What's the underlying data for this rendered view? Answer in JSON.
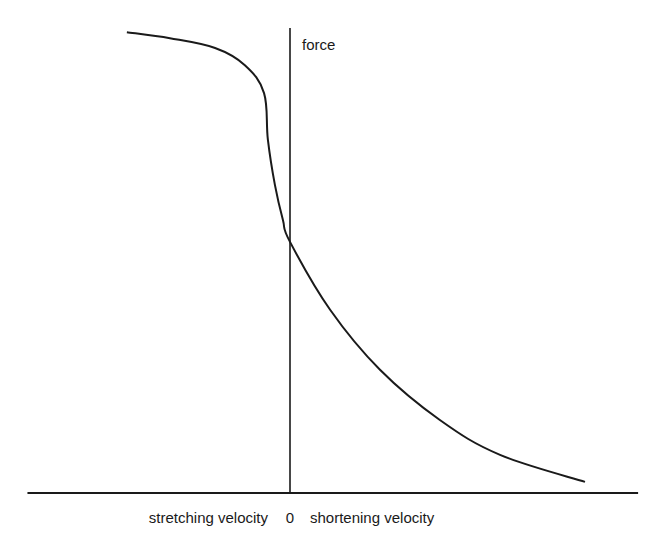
{
  "chart_data": {
    "type": "line",
    "title": "",
    "xlabel_left": "stretching velocity",
    "xlabel_right": "shortening velocity",
    "origin_label": "0",
    "ylabel": "force",
    "xlim": [
      -0.89,
      1.18
    ],
    "ylim": [
      0,
      1
    ],
    "grid": false,
    "legend": "none",
    "line_color": "#1a1a1a",
    "series": [
      {
        "name": "force-velocity",
        "x": [
          -0.553,
          -0.407,
          -0.254,
          -0.153,
          -0.088,
          -0.075,
          -0.051,
          -0.024,
          0.0,
          0.136,
          0.305,
          0.508,
          0.712,
          1.0
        ],
        "y": [
          0.991,
          0.978,
          0.957,
          0.92,
          0.86,
          0.76,
          0.662,
          0.587,
          0.54,
          0.394,
          0.265,
          0.157,
          0.082,
          0.024
        ]
      }
    ]
  }
}
